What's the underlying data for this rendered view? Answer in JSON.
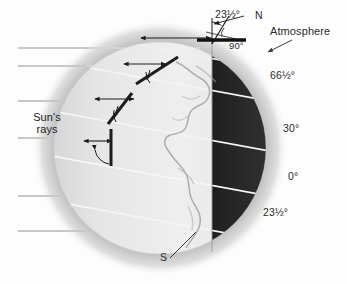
{
  "figure": {
    "background_color": "#fdfdfd"
  },
  "labels": {
    "sun_rays": "Sun's\nrays",
    "sun_rays_line1": "Sun's",
    "sun_rays_line2": "rays",
    "atmosphere": "Atmosphere",
    "north_pole": "N",
    "south_pole": "S",
    "axis_tilt": "23½°",
    "right_angle": "90°"
  },
  "latitudes": [
    {
      "id": "arctic-circle",
      "label": "66½°",
      "value": 66.5,
      "x": 277,
      "y": 78
    },
    {
      "id": "mid-north",
      "label": "30°",
      "value": 30,
      "x": 288,
      "y": 130
    },
    {
      "id": "equator",
      "label": "0°",
      "value": 0,
      "x": 293,
      "y": 178
    },
    {
      "id": "tropic-south",
      "label": "23½°",
      "value": 23.5,
      "x": 272,
      "y": 214
    }
  ],
  "sun_rays": {
    "count": 6,
    "color": "#c8c8c8",
    "y_positions": [
      48,
      66,
      101,
      138,
      196,
      231
    ],
    "x_start": 18,
    "x_end_default": 196
  },
  "globe": {
    "center_x": 160,
    "center_y": 148,
    "radius": 106,
    "terminator_x": 212,
    "lit_color": "#e9e9e9",
    "night_color": "#2b2b2b",
    "halo_color": "#bdbdbd",
    "axis_tilt_degrees": 23.5
  },
  "colors": {
    "ink": "#1c1c1c",
    "ray": "#c8c8c8",
    "halo": "#b8b8b8",
    "night": "#2b2b2b",
    "day": "#e8e8e8",
    "latitude_line": "#f2f2f2"
  },
  "markers": {
    "description": "Double-headed arrows showing atmospheric path length of sunlight at each latitude",
    "items": [
      {
        "id": "marker-pole",
        "latitude": "polar"
      },
      {
        "id": "marker-66",
        "latitude": "66½°"
      },
      {
        "id": "marker-30",
        "latitude": "30°"
      },
      {
        "id": "marker-0",
        "latitude": "0°"
      }
    ]
  }
}
